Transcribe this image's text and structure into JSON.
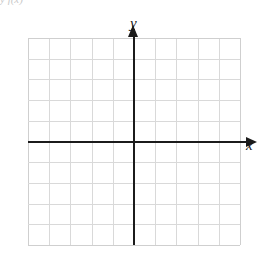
{
  "figure": {
    "kind": "blank-cartesian-coordinate-grid",
    "top_artifact_text": "y  f(x)"
  },
  "chart_data": {
    "type": "scatter",
    "title": "",
    "subtitle": "",
    "xlabel": "x",
    "ylabel": "y",
    "x": [],
    "values": [],
    "series": [],
    "annotations": [],
    "legend": [],
    "legend_position": "none",
    "grid": true,
    "grid_columns": 10,
    "grid_rows": 10,
    "xlim": [
      -5,
      5
    ],
    "ylim": [
      -5,
      5
    ],
    "xticks": [
      -5,
      -4,
      -3,
      -2,
      -1,
      0,
      1,
      2,
      3,
      4,
      5
    ],
    "yticks": [
      -5,
      -4,
      -3,
      -2,
      -1,
      0,
      1,
      2,
      3,
      4,
      5
    ],
    "xtick_labels": [],
    "ytick_labels": [],
    "origin": [
      0,
      0
    ],
    "axis_arrows": [
      "x-positive",
      "y-positive"
    ],
    "colors": {
      "axis": "#1b1b1b",
      "gridline": "#d9d9d9",
      "grid_edge": "#cfcfcf",
      "background": "#ffffff",
      "label": "#151515"
    }
  },
  "labels": {
    "x": "x",
    "y": "y"
  }
}
